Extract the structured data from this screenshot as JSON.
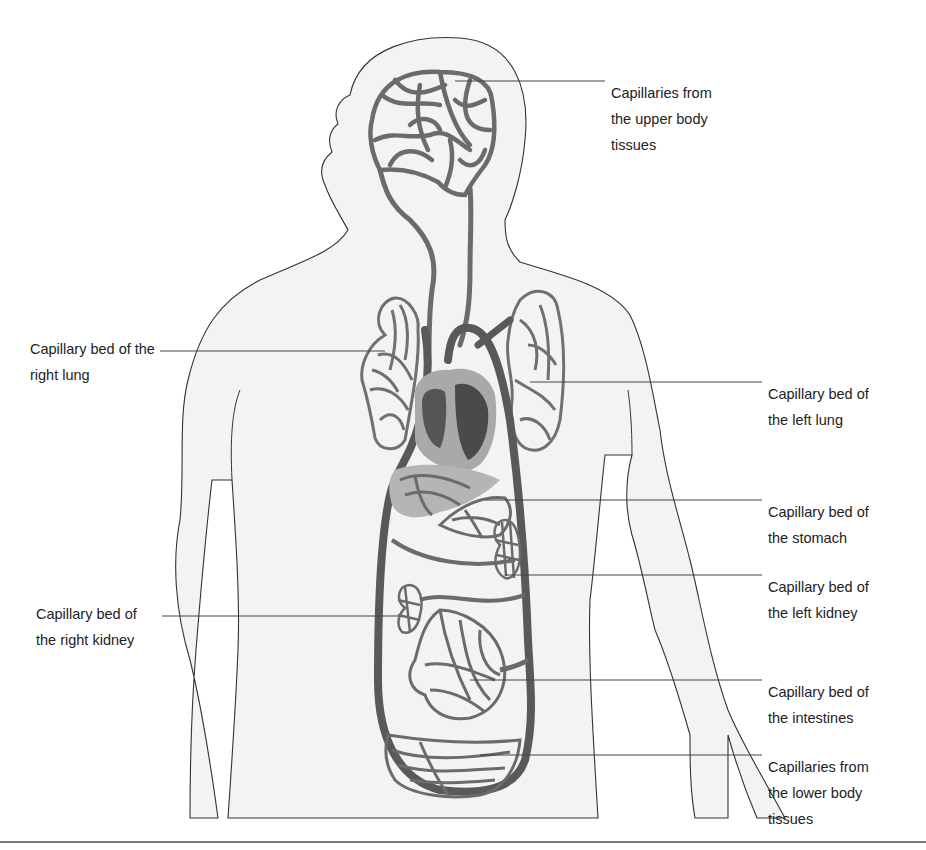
{
  "diagram": {
    "colors": {
      "body_fill": "#f3f3f3",
      "outline": "#333333",
      "vessel": "#6b6b6b",
      "vessel_dark": "#595959",
      "heart_light": "#a9a9a9",
      "heart_dark": "#555555",
      "liver_shade": "#b5b5b5",
      "leader_line": "#444444",
      "divider": "#7a7a7a"
    },
    "labels": [
      {
        "id": "upper-body",
        "lines": [
          "Capillaries from",
          "the upper body",
          "tissues"
        ],
        "side": "right"
      },
      {
        "id": "right-lung",
        "lines": [
          "Capillary bed of the",
          "right lung"
        ],
        "side": "left"
      },
      {
        "id": "left-lung",
        "lines": [
          "Capillary bed of",
          "the left lung"
        ],
        "side": "right"
      },
      {
        "id": "stomach",
        "lines": [
          "Capillary bed of",
          "the stomach"
        ],
        "side": "right"
      },
      {
        "id": "left-kidney",
        "lines": [
          "Capillary bed of",
          "the left kidney"
        ],
        "side": "right"
      },
      {
        "id": "right-kidney",
        "lines": [
          "Capillary bed of",
          "the right kidney"
        ],
        "side": "left"
      },
      {
        "id": "intestines",
        "lines": [
          "Capillary bed of",
          "the intestines"
        ],
        "side": "right"
      },
      {
        "id": "lower-body",
        "lines": [
          "Capillaries from",
          "the lower body",
          "tissues"
        ],
        "side": "right"
      }
    ]
  }
}
